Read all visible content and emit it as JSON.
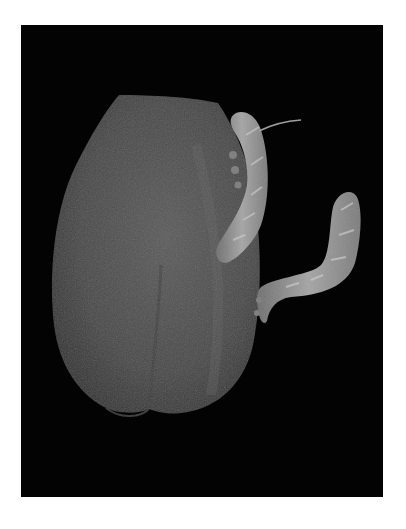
{
  "image": {
    "alt": "Grayscale photo of a bell pepper with two hornworm caterpillars on a black background",
    "subjects": [
      "bell-pepper",
      "hornworm-caterpillar",
      "hornworm-caterpillar"
    ],
    "colors": {
      "border": "#ffffff",
      "background": "#030303",
      "pepper": "#4a4a4a",
      "pepper_highlight": "#5c5c5c",
      "caterpillar": "#8a8a8a",
      "caterpillar_highlight": "#b5b5b5"
    }
  }
}
